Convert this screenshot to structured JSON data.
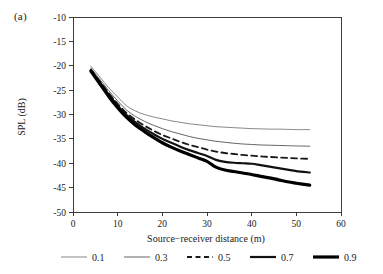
{
  "figure": {
    "panel_label": "(a)"
  },
  "chart_data": {
    "type": "line",
    "title": "",
    "xlabel": "Source−receiver distance (m)",
    "ylabel": "SPL (dB)",
    "xlim": [
      0,
      60
    ],
    "ylim": [
      -50,
      -10
    ],
    "xticks": [
      0,
      10,
      20,
      30,
      40,
      50,
      60
    ],
    "yticks": [
      -10,
      -15,
      -20,
      -25,
      -30,
      -35,
      -40,
      -45,
      -50
    ],
    "xticklabels": [
      "0",
      "10",
      "20",
      "30",
      "40",
      "50",
      "60"
    ],
    "yticklabels": [
      "-10",
      "-15",
      "-20",
      "-25",
      "-30",
      "-35",
      "-40",
      "-45",
      "-50"
    ],
    "grid": false,
    "legend_position": "below",
    "legend_title": "",
    "x": [
      4,
      6,
      8,
      10,
      12,
      14,
      16,
      18,
      20,
      22,
      24,
      26,
      28,
      30,
      32,
      34,
      36,
      38,
      40,
      42,
      44,
      46,
      48,
      50,
      53
    ],
    "series": [
      {
        "name": "0.1",
        "style": "solid",
        "width": 0.7,
        "color": "#555555",
        "values": [
          -20.1,
          -22.3,
          -24.5,
          -26.4,
          -28.2,
          -29.3,
          -30.0,
          -30.5,
          -30.9,
          -31.3,
          -31.6,
          -31.9,
          -32.1,
          -32.3,
          -32.5,
          -32.6,
          -32.7,
          -32.8,
          -32.9,
          -32.95,
          -33.0,
          -33.0,
          -33.05,
          -33.1,
          -33.1
        ]
      },
      {
        "name": "0.3",
        "style": "solid",
        "width": 0.9,
        "color": "#555555",
        "values": [
          -20.5,
          -22.8,
          -25.1,
          -27.2,
          -29.1,
          -30.4,
          -31.4,
          -32.2,
          -32.9,
          -33.5,
          -34.0,
          -34.5,
          -34.9,
          -35.2,
          -35.5,
          -35.7,
          -35.9,
          -36.05,
          -36.15,
          -36.25,
          -36.3,
          -36.35,
          -36.4,
          -36.45,
          -36.5
        ]
      },
      {
        "name": "0.5",
        "style": "dashed",
        "width": 1.8,
        "color": "#1a1a1a",
        "values": [
          -20.8,
          -23.2,
          -25.6,
          -27.8,
          -29.7,
          -31.1,
          -32.3,
          -33.3,
          -34.2,
          -34.9,
          -35.6,
          -36.2,
          -36.7,
          -37.2,
          -37.6,
          -37.9,
          -38.1,
          -38.3,
          -38.45,
          -38.6,
          -38.7,
          -38.8,
          -38.9,
          -39.0,
          -39.1
        ]
      },
      {
        "name": "0.7",
        "style": "solid",
        "width": 2.2,
        "color": "#111111",
        "values": [
          -20.9,
          -23.4,
          -25.9,
          -28.2,
          -30.1,
          -31.6,
          -32.9,
          -34.0,
          -35.0,
          -35.8,
          -36.6,
          -37.3,
          -37.9,
          -38.5,
          -39.3,
          -39.7,
          -39.9,
          -40.0,
          -40.1,
          -40.4,
          -40.7,
          -41.0,
          -41.3,
          -41.6,
          -41.9
        ]
      },
      {
        "name": "0.9",
        "style": "solid",
        "width": 3.2,
        "color": "#000000",
        "values": [
          -21.1,
          -23.7,
          -26.3,
          -28.6,
          -30.6,
          -32.2,
          -33.5,
          -34.7,
          -35.8,
          -36.7,
          -37.5,
          -38.2,
          -38.9,
          -39.6,
          -40.8,
          -41.4,
          -41.7,
          -42.0,
          -42.3,
          -42.7,
          -43.0,
          -43.4,
          -43.8,
          -44.1,
          -44.5
        ]
      }
    ]
  },
  "legend": {
    "items": [
      {
        "label": "0.1"
      },
      {
        "label": "0.3"
      },
      {
        "label": "0.5"
      },
      {
        "label": "0.7"
      },
      {
        "label": "0.9"
      }
    ]
  }
}
